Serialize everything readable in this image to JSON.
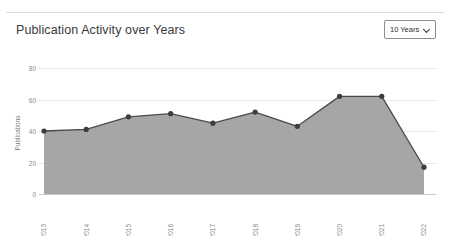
{
  "header": {
    "title": "Publication Activity over Years",
    "range_select": {
      "value": "10 Years",
      "icon": "chevron-down-icon"
    }
  },
  "chart_data": {
    "type": "area",
    "title": "Publication Activity over Years",
    "xlabel": "",
    "ylabel": "Publications",
    "categories": [
      "2013",
      "2014",
      "2015",
      "2016",
      "2017",
      "2018",
      "2019",
      "2020",
      "2021",
      "2022"
    ],
    "values": [
      40,
      41,
      49,
      51,
      45,
      52,
      43,
      62,
      62,
      17
    ],
    "series": [
      {
        "name": "Publications",
        "values": [
          40,
          41,
          49,
          51,
          45,
          52,
          43,
          62,
          62,
          17
        ]
      }
    ],
    "ylim": [
      0,
      80
    ],
    "yticks": [
      0,
      20,
      40,
      60,
      80
    ],
    "grid": true,
    "legend": "none",
    "area_color": "#a6a6a6",
    "line_color": "#4a4a4a",
    "marker_color": "#3d3d3d"
  }
}
